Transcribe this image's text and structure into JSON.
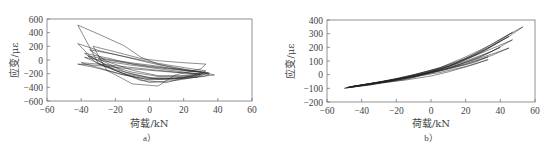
{
  "chart_data": [
    {
      "id": "a",
      "type": "line",
      "title": "",
      "caption": "a）",
      "xlabel": "荷载/kN",
      "ylabel": "应变/με",
      "xlim": [
        -60,
        60
      ],
      "ylim": [
        -600,
        600
      ],
      "xticks": [
        -60,
        -40,
        -20,
        0,
        20,
        40,
        60
      ],
      "yticks": [
        600,
        400,
        200,
        0,
        -200,
        -400,
        -600
      ],
      "grid": false,
      "legend": null,
      "description": "Hysteresis loops of strain vs load; strain decreases with load from about +500 με at -42 kN down to about -380 με near 5 kN, curves end near -220 με at 38 kN",
      "series": [
        {
          "name": "loop1",
          "x": [
            -42,
            -30,
            -15,
            -5,
            5,
            15,
            25,
            35,
            38,
            30,
            15,
            0,
            -15,
            -30,
            -42
          ],
          "y": [
            510,
            380,
            210,
            40,
            -60,
            -110,
            -160,
            -200,
            -220,
            -240,
            -300,
            -330,
            -200,
            -50,
            510
          ]
        },
        {
          "name": "loop2",
          "x": [
            -42,
            -30,
            -15,
            0,
            15,
            30,
            35,
            25,
            10,
            -5,
            -20,
            -35,
            -42
          ],
          "y": [
            240,
            140,
            50,
            -40,
            -120,
            -170,
            -190,
            -230,
            -330,
            -300,
            -150,
            60,
            240
          ]
        },
        {
          "name": "loop3",
          "x": [
            -33,
            -20,
            -5,
            5,
            20,
            33,
            30,
            15,
            5,
            -10,
            -25,
            -33
          ],
          "y": [
            200,
            120,
            20,
            -10,
            -40,
            -60,
            -130,
            -220,
            -380,
            -350,
            -150,
            200
          ]
        },
        {
          "name": "loop4",
          "x": [
            -38,
            -25,
            -10,
            0,
            15,
            30,
            28,
            15,
            0,
            -15,
            -30,
            -38
          ],
          "y": [
            100,
            30,
            -60,
            -100,
            -140,
            -180,
            -230,
            -260,
            -270,
            -200,
            -60,
            100
          ]
        },
        {
          "name": "loop5",
          "x": [
            -36,
            -22,
            -8,
            5,
            20,
            32,
            30,
            18,
            5,
            -10,
            -25,
            -36
          ],
          "y": [
            60,
            0,
            -50,
            -90,
            -150,
            -180,
            -210,
            -240,
            -240,
            -180,
            -70,
            60
          ]
        },
        {
          "name": "loop6",
          "x": [
            -40,
            -25,
            -10,
            5,
            20,
            30,
            28,
            15,
            0,
            -15,
            -30,
            -40
          ],
          "y": [
            -40,
            -70,
            -110,
            -150,
            -190,
            -210,
            -250,
            -280,
            -290,
            -220,
            -110,
            -40
          ]
        },
        {
          "name": "loop7",
          "x": [
            -42,
            -30,
            -15,
            0,
            15,
            28,
            25,
            12,
            -2,
            -18,
            -32,
            -42
          ],
          "y": [
            -60,
            -80,
            -120,
            -150,
            -180,
            -200,
            -240,
            -270,
            -280,
            -200,
            -110,
            -60
          ]
        },
        {
          "name": "loop8",
          "x": [
            -35,
            -20,
            -5,
            10,
            25,
            33,
            30,
            18,
            5,
            -10,
            -25,
            -35
          ],
          "y": [
            150,
            80,
            0,
            -70,
            -130,
            -160,
            -200,
            -230,
            -230,
            -150,
            -20,
            150
          ]
        },
        {
          "name": "loop9",
          "x": [
            -30,
            -15,
            0,
            15,
            28,
            34,
            30,
            15,
            0,
            -15,
            -30
          ],
          "y": [
            20,
            -40,
            -90,
            -130,
            -170,
            -190,
            -230,
            -270,
            -260,
            -170,
            20
          ]
        },
        {
          "name": "loop10",
          "x": [
            -38,
            -25,
            -12,
            0,
            12,
            25,
            35,
            32,
            20,
            5,
            -10,
            -25,
            -38
          ],
          "y": [
            40,
            -20,
            -70,
            -110,
            -150,
            -190,
            -210,
            -240,
            -270,
            -280,
            -210,
            -100,
            40
          ]
        }
      ]
    },
    {
      "id": "b",
      "type": "line",
      "title": "",
      "caption": "b）",
      "xlabel": "荷载/kN",
      "ylabel": "应变/με",
      "xlim": [
        -60,
        60
      ],
      "ylim": [
        -200,
        400
      ],
      "xticks": [
        -60,
        -40,
        -20,
        0,
        20,
        40,
        60
      ],
      "yticks": [
        400,
        300,
        200,
        100,
        0,
        -100,
        -200
      ],
      "grid": false,
      "legend": null,
      "description": "Hysteresis loops of strain vs load; strain increases with load from about -100 με at -50 kN to about +350 με at 53 kN, loops fan out at high load (endpoints near 350, 300, 250, 190, 130, 110 με)",
      "series": [
        {
          "name": "loop1",
          "x": [
            -50,
            -30,
            -10,
            0,
            15,
            30,
            45,
            53,
            40,
            25,
            10,
            0,
            -20,
            -40,
            -50
          ],
          "y": [
            -100,
            -60,
            -20,
            20,
            80,
            170,
            280,
            350,
            260,
            150,
            60,
            20,
            -40,
            -80,
            -100
          ]
        },
        {
          "name": "loop2",
          "x": [
            -49,
            -30,
            -10,
            5,
            20,
            35,
            47,
            35,
            20,
            5,
            -15,
            -35,
            -49
          ],
          "y": [
            -95,
            -55,
            0,
            50,
            120,
            210,
            310,
            220,
            130,
            50,
            -20,
            -70,
            -95
          ]
        },
        {
          "name": "loop3",
          "x": [
            -48,
            -30,
            -10,
            5,
            20,
            35,
            47,
            35,
            20,
            5,
            -15,
            -35,
            -48
          ],
          "y": [
            -95,
            -60,
            -10,
            40,
            100,
            170,
            255,
            190,
            110,
            40,
            -25,
            -75,
            -95
          ]
        },
        {
          "name": "loop4",
          "x": [
            -47,
            -30,
            -10,
            5,
            20,
            35,
            45,
            35,
            20,
            5,
            -15,
            -35,
            -47
          ],
          "y": [
            -90,
            -55,
            -10,
            30,
            80,
            140,
            195,
            150,
            90,
            30,
            -30,
            -70,
            -90
          ]
        },
        {
          "name": "loop5",
          "x": [
            -46,
            -30,
            -10,
            5,
            20,
            33,
            25,
            10,
            0,
            -15,
            -35,
            -46
          ],
          "y": [
            -90,
            -55,
            -10,
            30,
            75,
            130,
            90,
            40,
            10,
            -35,
            -75,
            -90
          ]
        },
        {
          "name": "loop6",
          "x": [
            -45,
            -30,
            -10,
            5,
            20,
            33,
            25,
            10,
            0,
            -15,
            -35,
            -45
          ],
          "y": [
            -85,
            -55,
            -15,
            15,
            60,
            110,
            75,
            20,
            -10,
            -40,
            -70,
            -85
          ]
        },
        {
          "name": "loop7",
          "x": [
            -48,
            -25,
            -5,
            10,
            25,
            45,
            30,
            15,
            0,
            -20,
            -40,
            -48
          ],
          "y": [
            -92,
            -45,
            10,
            60,
            140,
            280,
            170,
            90,
            30,
            -30,
            -75,
            -92
          ]
        },
        {
          "name": "loop8",
          "x": [
            -47,
            -25,
            -5,
            10,
            25,
            40,
            30,
            15,
            0,
            -20,
            -40,
            -47
          ],
          "y": [
            -90,
            -50,
            0,
            45,
            110,
            200,
            140,
            70,
            15,
            -35,
            -75,
            -90
          ]
        }
      ]
    }
  ]
}
